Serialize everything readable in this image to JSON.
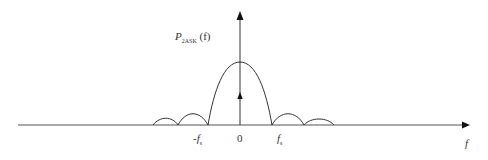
{
  "diagram": {
    "y_axis_label": {
      "base": "P",
      "subscript": "2ASK",
      "arg": "(f)"
    },
    "x_axis_label": "f",
    "ticks": [
      {
        "base": "-f",
        "subscript": "s"
      },
      {
        "base": "0",
        "subscript": ""
      },
      {
        "base": "f",
        "subscript": "s"
      }
    ],
    "colors": {
      "line": "#333333",
      "background": "#ffffff"
    }
  }
}
